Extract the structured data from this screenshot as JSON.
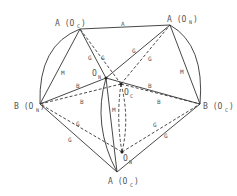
{
  "diagram": {
    "vertices": [
      {
        "id": "top_left",
        "label": "A",
        "sub_label": "O",
        "sub": "C",
        "x": 80,
        "y": 29
      },
      {
        "id": "top_right",
        "label": "A",
        "sub_label": "O",
        "sub": "N",
        "x": 170,
        "y": 25
      },
      {
        "id": "left",
        "label": "B",
        "sub_label": "O",
        "sub": "N",
        "x": 40,
        "y": 104
      },
      {
        "id": "right",
        "label": "B",
        "sub_label": "O",
        "sub": "C",
        "x": 200,
        "y": 104
      },
      {
        "id": "bottom",
        "label": "A",
        "sub_label": "O",
        "sub": "C",
        "x": 117,
        "y": 172
      }
    ],
    "centers": [
      {
        "id": "center_n",
        "label": "O",
        "sub": "N",
        "x": 106,
        "y": 78
      },
      {
        "id": "center_c",
        "label": "O",
        "sub": "C",
        "x": 121,
        "y": 84
      },
      {
        "id": "lower_n",
        "label": "O",
        "sub": "N",
        "x": 122,
        "y": 152
      }
    ],
    "edge_labels": {
      "top": "A",
      "left_upper": "M",
      "right_upper": "M",
      "center_vertical": "M",
      "g": "G",
      "b": "B"
    }
  }
}
